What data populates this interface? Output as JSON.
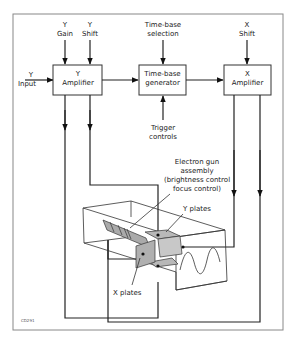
{
  "diagram": {
    "code": "CD291",
    "inputs": {
      "y_gain": [
        "Y",
        "Gain"
      ],
      "y_shift": [
        "Y",
        "Shift"
      ],
      "y_input": [
        "Y",
        "Input"
      ],
      "timebase_selection": [
        "Time-base",
        "selection"
      ],
      "x_shift": [
        "X",
        "Shift"
      ],
      "trigger": [
        "Trigger",
        "controls"
      ]
    },
    "blocks": {
      "y_amplifier": [
        "Y",
        "Amplifier"
      ],
      "timebase_generator": [
        "Time-base",
        "generator"
      ],
      "x_amplifier": [
        "X",
        "Amplifier"
      ]
    },
    "callouts": {
      "electron_gun": [
        "Electron gun",
        "assembly",
        "(brightness control",
        "focus control)"
      ],
      "y_plates": "Y plates",
      "x_plates": "X plates"
    },
    "colors": {
      "line": "#222222",
      "frame": "#888888",
      "plate": "#b8b8b8"
    }
  }
}
